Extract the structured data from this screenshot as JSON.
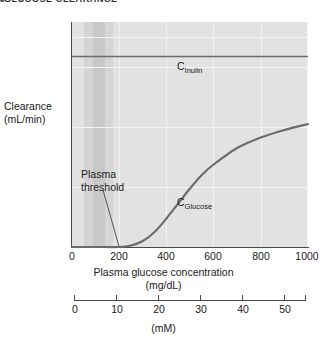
{
  "header": {
    "bullet": "■",
    "title": "GLUCOSE CLEARANCE"
  },
  "chart_data": {
    "type": "line",
    "xlabel": "Plasma glucose concentration",
    "xlabel_units": "(mg/dL)",
    "ylabel": "Clearance",
    "ylabel_units": "(mL/min)",
    "secondary_xlabel": "(mM)",
    "xlim": [
      0,
      1000
    ],
    "ylim": [
      0,
      150
    ],
    "secondary_xlim": [
      0,
      55.5
    ],
    "grid": true,
    "legend_position": "inline-labels",
    "xticks": [
      0,
      200,
      400,
      600,
      800,
      1000
    ],
    "xtick_labels": [
      "0",
      "200",
      "400",
      "600",
      "800",
      "1000"
    ],
    "yticks": [
      0,
      40,
      80,
      120,
      140
    ],
    "ytick_labels": [
      "0",
      "40",
      "80",
      "120",
      "140"
    ],
    "secondary_xticks": [
      0,
      10,
      20,
      30,
      40,
      50
    ],
    "secondary_xtick_labels": [
      "0",
      "10",
      "20",
      "30",
      "40",
      "50"
    ],
    "series": [
      {
        "name": "C_Inulin",
        "label": "C",
        "label_sub": "Inulin",
        "color": "#6b6b6b",
        "constant_value": 127,
        "x": [
          0,
          1000
        ],
        "values": [
          127,
          127
        ]
      },
      {
        "name": "C_Glucose",
        "label": "C",
        "label_sub": "Glucose",
        "color": "#6b6b6b",
        "x": [
          0,
          100,
          200,
          250,
          300,
          350,
          400,
          450,
          500,
          550,
          600,
          700,
          800,
          900,
          1000
        ],
        "values": [
          0,
          0,
          0,
          1,
          4,
          10,
          19,
          29,
          39,
          48,
          55,
          66,
          73,
          78,
          82
        ]
      }
    ],
    "annotations": [
      {
        "name": "plasma-threshold",
        "text_line1": "Plasma",
        "text_line2": "threshold",
        "points_to_x": 200,
        "points_to_y": 0
      }
    ],
    "shaded_bands": [
      {
        "name": "normal-range-band",
        "x_start": 50,
        "x_end": 90,
        "color": "#d4d4d4"
      },
      {
        "name": "normal-range-band-core",
        "x_start": 90,
        "x_end": 140,
        "color": "#c8c8c8"
      },
      {
        "name": "normal-range-band-outer",
        "x_start": 140,
        "x_end": 175,
        "color": "#d6d6d6"
      }
    ],
    "plot_background": "#e2e2e2",
    "gridline_color": "#f2f2f2",
    "axis_color": "#4a4a4a"
  }
}
